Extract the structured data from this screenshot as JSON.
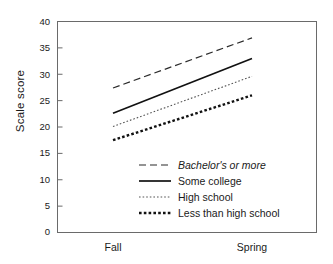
{
  "chart_data": {
    "type": "line",
    "title": "",
    "subtitle": "",
    "xlabel": "",
    "ylabel": "Scale score",
    "categories": [
      "Fall",
      "Spring"
    ],
    "x": [
      0,
      1
    ],
    "ylim": [
      0,
      40
    ],
    "yticks": [
      0,
      5,
      10,
      15,
      20,
      25,
      30,
      35,
      40
    ],
    "ytick_labels": [
      "0",
      "5",
      "10",
      "15",
      "20",
      "25",
      "30",
      "35",
      "40"
    ],
    "xtick_labels": [
      "Fall",
      "Spring"
    ],
    "grid": false,
    "legend_position": "inside-lower-right",
    "series": [
      {
        "name": "Bachelor's or more",
        "values": [
          27.4,
          36.9
        ],
        "style": "dashed",
        "color": "#2b2b2b",
        "width": 1.2,
        "dash": "7,4",
        "italic_label": true
      },
      {
        "name": "Some college",
        "values": [
          22.6,
          33.0
        ],
        "style": "solid",
        "color": "#111111",
        "width": 1.7,
        "dash": "",
        "italic_label": false
      },
      {
        "name": "High school",
        "values": [
          20.1,
          29.6
        ],
        "style": "dotted",
        "color": "#545454",
        "width": 1.1,
        "dash": "1.6,2",
        "italic_label": false
      },
      {
        "name": "Less than high school",
        "values": [
          17.5,
          26.0
        ],
        "style": "thick-dotted",
        "color": "#111111",
        "width": 2.4,
        "dash": "2.6,2.2",
        "italic_label": false
      }
    ],
    "annotations": []
  },
  "legend": {
    "items": [
      "Bachelor's or more",
      "Some college",
      "High school",
      "Less than high school"
    ]
  },
  "axis": {
    "y_label": "Scale score",
    "y_ticks": [
      "40",
      "35",
      "30",
      "25",
      "20",
      "15",
      "10",
      "5",
      "0"
    ],
    "x_ticks": [
      "Fall",
      "Spring"
    ]
  }
}
